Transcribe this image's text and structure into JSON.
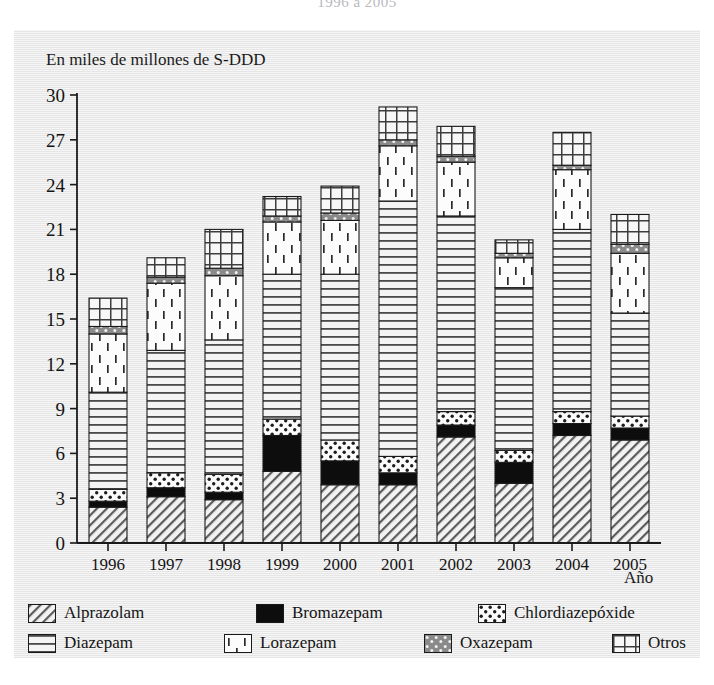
{
  "figure": {
    "title_partial": "1996 a 2005",
    "y_axis_caption": "En miles de millones de S-DDD",
    "x_axis_caption": "Año"
  },
  "legend": {
    "rows": [
      [
        {
          "key": "alprazolam",
          "label": "Alprazolam",
          "pattern": "diagonal-hatch"
        },
        {
          "key": "bromazepam",
          "label": "Bromazepam",
          "pattern": "solid-black"
        },
        {
          "key": "chlordiazepoxide",
          "label": "Chlordiazepóxide",
          "pattern": "dots-white"
        }
      ],
      [
        {
          "key": "diazepam",
          "label": "Diazepam",
          "pattern": "horizontal-lines"
        },
        {
          "key": "lorazepam",
          "label": "Lorazepam",
          "pattern": "dashes"
        },
        {
          "key": "oxazepam",
          "label": "Oxazepam",
          "pattern": "gray-dots"
        },
        {
          "key": "otros",
          "label": "Otros",
          "pattern": "grid"
        }
      ]
    ]
  },
  "chart_data": {
    "type": "bar",
    "subtype": "stacked-vertical",
    "title": "1996 a 2005",
    "xlabel": "Año",
    "ylabel": "En miles de millones de S-DDD",
    "ylim": [
      0,
      30
    ],
    "yticks": [
      0,
      3,
      6,
      9,
      12,
      15,
      18,
      21,
      24,
      27,
      30
    ],
    "grid": false,
    "legend_position": "bottom",
    "categories": [
      "1996",
      "1997",
      "1998",
      "1999",
      "2000",
      "2001",
      "2002",
      "2003",
      "2004",
      "2005"
    ],
    "series": [
      {
        "name": "Alprazolam",
        "pattern": "diagonal-hatch",
        "values": [
          2.4,
          3.1,
          2.9,
          4.8,
          3.9,
          3.9,
          7.1,
          4.0,
          7.2,
          6.9
        ]
      },
      {
        "name": "Bromazepam",
        "pattern": "solid-black",
        "values": [
          0.4,
          0.6,
          0.5,
          2.4,
          1.6,
          0.8,
          0.8,
          1.4,
          0.8,
          0.8
        ]
      },
      {
        "name": "Chlordiazepóxide",
        "pattern": "dots-white",
        "values": [
          0.8,
          1.0,
          1.2,
          1.1,
          1.4,
          1.1,
          0.9,
          0.8,
          0.8,
          0.8
        ]
      },
      {
        "name": "Diazepam",
        "pattern": "horizontal-lines",
        "values": [
          6.5,
          8.2,
          9.0,
          9.7,
          11.1,
          17.1,
          13.1,
          10.9,
          12.2,
          6.9
        ]
      },
      {
        "name": "Lorazepam",
        "pattern": "dashes",
        "values": [
          3.9,
          4.5,
          4.3,
          3.5,
          3.6,
          3.7,
          3.6,
          2.0,
          4.0,
          4.0
        ]
      },
      {
        "name": "Oxazepam",
        "pattern": "gray-dots",
        "values": [
          0.5,
          0.4,
          0.5,
          0.4,
          0.5,
          0.4,
          0.4,
          0.3,
          0.3,
          0.6
        ]
      },
      {
        "name": "Otros",
        "pattern": "grid",
        "values": [
          1.9,
          1.3,
          2.6,
          1.3,
          1.8,
          2.2,
          2.0,
          0.9,
          2.2,
          2.0
        ]
      }
    ],
    "totals": [
      16.4,
      19.1,
      21.0,
      23.2,
      23.9,
      29.2,
      27.9,
      20.3,
      27.5,
      22.0
    ]
  },
  "plot_geometry": {
    "x0": 89,
    "bar_width": 38,
    "bar_gap": 20,
    "step": 58,
    "y_baseline": 543,
    "y_top": 95,
    "px_per_unit": 14.933
  }
}
